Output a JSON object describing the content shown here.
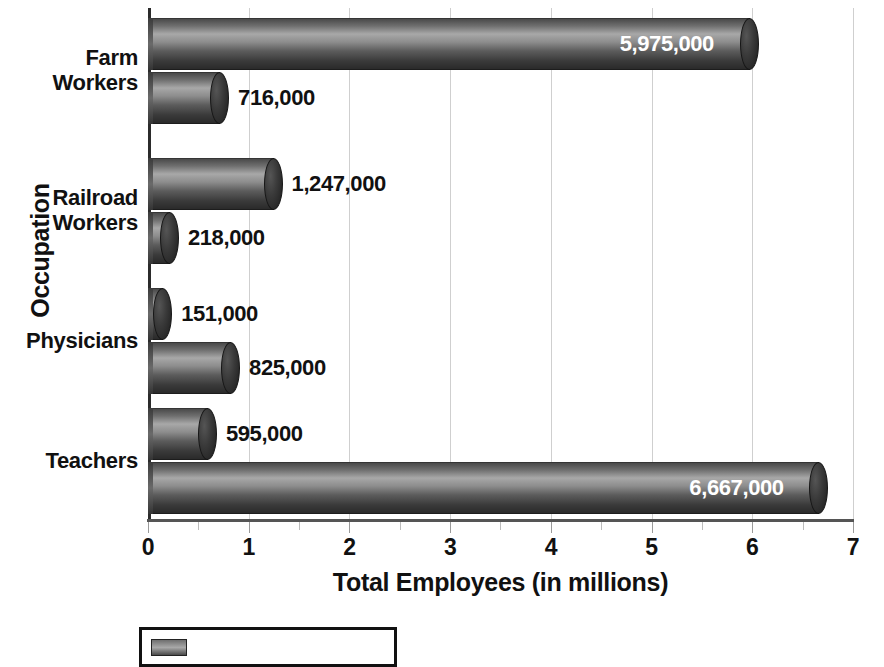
{
  "chart_data": {
    "type": "bar",
    "orientation": "horizontal",
    "title": "",
    "xlabel": "Total Employees (in millions)",
    "ylabel": "Occupation",
    "xlim": [
      0,
      7
    ],
    "xticks": [
      0,
      1,
      2,
      3,
      4,
      5,
      6,
      7
    ],
    "xtick_labels": [
      "0",
      "1",
      "2",
      "3",
      "4",
      "5",
      "6",
      "7"
    ],
    "minor_tick_step": 0.5,
    "grid": true,
    "grid_axis": "x",
    "value_unit": "millions",
    "categories": [
      "Farm Workers",
      "Railroad Workers",
      "Physicians",
      "Teachers"
    ],
    "series": [
      {
        "name": "Series 1",
        "values": [
          5975000,
          1247000,
          151000,
          595000
        ],
        "value_labels": [
          "5,975,000",
          "1,247,000",
          "151,000",
          "595,000"
        ],
        "values_millions": [
          5.975,
          1.247,
          0.151,
          0.595
        ]
      },
      {
        "name": "Series 2",
        "values": [
          716000,
          218000,
          825000,
          6667000
        ],
        "value_labels": [
          "716,000",
          "218,000",
          "825,000",
          "6,667,000"
        ],
        "values_millions": [
          0.716,
          0.218,
          0.825,
          6.667
        ]
      }
    ],
    "bars": [
      {
        "category": "Farm Workers",
        "series": "Series 1",
        "value": 5975000,
        "label": "5,975,000",
        "millions": 5.975,
        "label_inside": true
      },
      {
        "category": "Farm Workers",
        "series": "Series 2",
        "value": 716000,
        "label": "716,000",
        "millions": 0.716,
        "label_inside": false
      },
      {
        "category": "Railroad Workers",
        "series": "Series 1",
        "value": 1247000,
        "label": "1,247,000",
        "millions": 1.247,
        "label_inside": false
      },
      {
        "category": "Railroad Workers",
        "series": "Series 2",
        "value": 218000,
        "label": "218,000",
        "millions": 0.218,
        "label_inside": false
      },
      {
        "category": "Physicians",
        "series": "Series 1",
        "value": 151000,
        "label": "151,000",
        "millions": 0.151,
        "label_inside": false
      },
      {
        "category": "Physicians",
        "series": "Series 2",
        "value": 825000,
        "label": "825,000",
        "millions": 0.825,
        "label_inside": false
      },
      {
        "category": "Teachers",
        "series": "Series 1",
        "value": 595000,
        "label": "595,000",
        "millions": 0.595,
        "label_inside": false
      },
      {
        "category": "Teachers",
        "series": "Series 2",
        "value": 6667000,
        "label": "6,667,000",
        "millions": 6.667,
        "label_inside": true
      }
    ],
    "colors": {
      "bar_light": "#a8a8a8",
      "bar_mid": "#6f6f6f",
      "bar_dark": "#2a2a2a",
      "grid": "#cfcfcf",
      "axis": "#2b2b2b",
      "text": "#111111",
      "inside_label": "#ffffff",
      "background": "#ffffff"
    }
  },
  "axes": {
    "y_title": "Occupation",
    "x_title": "Total Employees (in millions)",
    "category_labels": [
      {
        "line1": "Farm",
        "line2": "Workers"
      },
      {
        "line1": "Railroad",
        "line2": "Workers"
      },
      {
        "line1": "Physicians",
        "line2": ""
      },
      {
        "line1": "Teachers",
        "line2": ""
      }
    ],
    "x_tick_labels": [
      "0",
      "1",
      "2",
      "3",
      "4",
      "5",
      "6",
      "7"
    ]
  },
  "legend": {
    "visible": true,
    "clipped": true,
    "note": "legend box is cut off by the bottom edge of the screenshot",
    "entry_label": ""
  },
  "title_remnant": ""
}
